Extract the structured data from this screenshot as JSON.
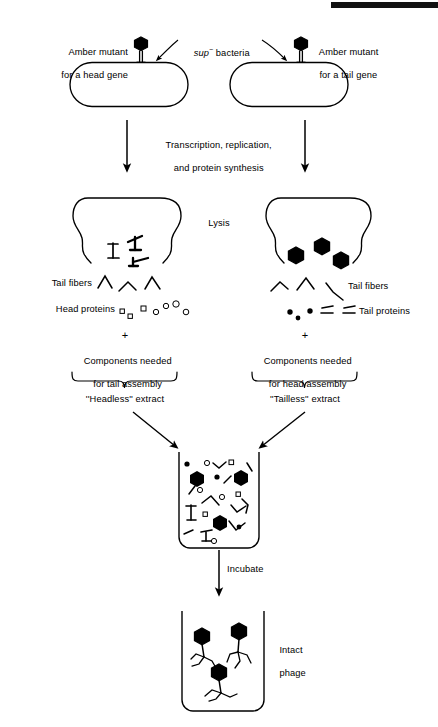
{
  "figure": {
    "title_bar": {
      "name": "top-black-rule",
      "color": "#111111"
    },
    "background": "#ffffff",
    "ink": "#000000"
  },
  "labels": {
    "amber_head_line1": "Amber mutant",
    "amber_head_line2": "for a head gene",
    "amber_tail_line1": "Amber mutant",
    "amber_tail_line2": "for a tail gene",
    "sup_italic": "sup",
    "sup_minus": "−",
    "sup_rest": " bacteria",
    "transcription_line1": "Transcription, replication,",
    "transcription_line2": "and protein synthesis",
    "lysis": "Lysis",
    "tail_fibers_left": "Tail fibers",
    "head_proteins": "Head proteins",
    "tail_fibers_right": "Tail fibers",
    "tail_proteins": "Tail proteins",
    "plus_left": "+",
    "plus_right": "+",
    "components_tail_line1": "Components needed",
    "components_tail_line2": "for tail assembly",
    "components_head_line1": "Components needed",
    "components_head_line2": "for head assembly",
    "headless_extract": "''Headless'' extract",
    "tailless_extract": "''Tailless'' extract",
    "incubate": "Incubate",
    "intact_line1": "Intact",
    "intact_line2": "phage"
  },
  "diagram": {
    "type": "biological-process-flow",
    "steps": [
      {
        "id": "infection",
        "label": "sup- bacteria infected by amber mutant phage"
      },
      {
        "id": "synthesis",
        "label": "Transcription, replication, and protein synthesis"
      },
      {
        "id": "lysis",
        "label": "Lysis"
      },
      {
        "id": "extracts",
        "label": "Headless and Tailless extracts"
      },
      {
        "id": "mixing",
        "label": "Mix extracts in tube"
      },
      {
        "id": "incubate",
        "label": "Incubate"
      },
      {
        "id": "result",
        "label": "Intact phage"
      }
    ],
    "left_branch": {
      "mutant": "head gene",
      "produces": [
        "tail structures",
        "tail fibers",
        "head proteins"
      ],
      "extract_name": "Headless"
    },
    "right_branch": {
      "mutant": "tail gene",
      "produces": [
        "phage heads",
        "tail fibers",
        "tail proteins"
      ],
      "extract_name": "Tailless"
    },
    "counts": {
      "left_head_proteins_squares": 3,
      "left_head_proteins_circles": 4,
      "left_tail_fibers": 3,
      "left_tail_structures": 3,
      "right_heads": 3,
      "right_tail_fibers": 3,
      "right_tail_protein_dots": 3,
      "right_tail_protein_dashes": 4,
      "final_intact_phage": 3
    }
  }
}
